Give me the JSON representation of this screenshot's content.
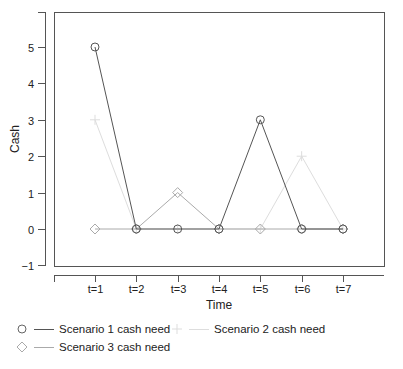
{
  "chart_data": {
    "type": "line",
    "title": "",
    "xlabel": "Time",
    "ylabel": "Cash",
    "categories": [
      "t=1",
      "t=2",
      "t=3",
      "t=4",
      "t=5",
      "t=6",
      "t=7"
    ],
    "yticks": [
      -1,
      0,
      1,
      2,
      3,
      4,
      5
    ],
    "ylim": [
      -1,
      5.9
    ],
    "grid": false,
    "legend_position": "bottom",
    "series": [
      {
        "name": "Scenario 1 cash need",
        "marker": "circle",
        "color": "#555555",
        "values": [
          5,
          0,
          0,
          0,
          3,
          0,
          0
        ]
      },
      {
        "name": "Scenario 2 cash need",
        "marker": "plus",
        "color": "#dddddd",
        "values": [
          3,
          0,
          0,
          0,
          0,
          2,
          0
        ]
      },
      {
        "name": "Scenario 3 cash need",
        "marker": "diamond",
        "color": "#aaaaaa",
        "values": [
          0,
          0,
          1,
          0,
          0,
          0,
          0
        ]
      }
    ]
  }
}
